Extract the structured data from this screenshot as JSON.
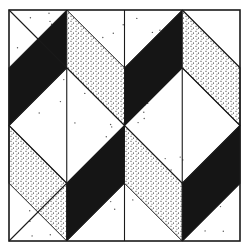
{
  "figure": {
    "type": "quilt-block-pattern",
    "colors": {
      "background": "#ffffff",
      "line": "#1a1a1a",
      "solid": "#151515",
      "stipple_dot": "#2a2a2a"
    },
    "grid": {
      "x0": 9,
      "y0": 10,
      "size": 231,
      "divisions": 4
    },
    "patches": [
      {
        "kind": "solid",
        "points": [
          [
            0,
            1
          ],
          [
            1,
            0
          ],
          [
            1,
            1
          ],
          [
            0,
            2
          ]
        ]
      },
      {
        "kind": "stipple",
        "points": [
          [
            1,
            0
          ],
          [
            2,
            1
          ],
          [
            2,
            2
          ],
          [
            1,
            1
          ]
        ]
      },
      {
        "kind": "solid",
        "points": [
          [
            2,
            1
          ],
          [
            3,
            0
          ],
          [
            3,
            1
          ],
          [
            2,
            2
          ]
        ]
      },
      {
        "kind": "stipple",
        "points": [
          [
            3,
            0
          ],
          [
            4,
            1
          ],
          [
            4,
            2
          ],
          [
            3,
            1
          ]
        ]
      },
      {
        "kind": "stipple",
        "points": [
          [
            0,
            2
          ],
          [
            1,
            3
          ],
          [
            1,
            4
          ],
          [
            0,
            3
          ]
        ]
      },
      {
        "kind": "solid",
        "points": [
          [
            1,
            3
          ],
          [
            2,
            2
          ],
          [
            2,
            3
          ],
          [
            1,
            4
          ]
        ]
      },
      {
        "kind": "stipple",
        "points": [
          [
            2,
            2
          ],
          [
            3,
            3
          ],
          [
            3,
            4
          ],
          [
            2,
            3
          ]
        ]
      },
      {
        "kind": "solid",
        "points": [
          [
            3,
            3
          ],
          [
            4,
            2
          ],
          [
            4,
            3
          ],
          [
            3,
            4
          ]
        ]
      }
    ],
    "lines": [
      [
        [
          2,
          0
        ],
        [
          2,
          1
        ]
      ],
      [
        [
          1,
          1
        ],
        [
          1,
          3
        ]
      ],
      [
        [
          3,
          1
        ],
        [
          3,
          3
        ]
      ],
      [
        [
          2,
          3
        ],
        [
          2,
          4
        ]
      ],
      [
        [
          0,
          2
        ],
        [
          1,
          1
        ]
      ],
      [
        [
          1,
          1
        ],
        [
          2,
          2
        ]
      ],
      [
        [
          2,
          2
        ],
        [
          3,
          1
        ]
      ],
      [
        [
          3,
          1
        ],
        [
          4,
          2
        ]
      ],
      [
        [
          0,
          2
        ],
        [
          1,
          3
        ]
      ],
      [
        [
          1,
          3
        ],
        [
          2,
          2
        ]
      ],
      [
        [
          2,
          2
        ],
        [
          3,
          3
        ]
      ],
      [
        [
          3,
          3
        ],
        [
          4,
          2
        ]
      ],
      [
        [
          0,
          0
        ],
        [
          1,
          1
        ]
      ],
      [
        [
          3,
          0
        ],
        [
          4,
          1
        ]
      ],
      [
        [
          0,
          4
        ],
        [
          1,
          3
        ]
      ],
      [
        [
          3,
          4
        ],
        [
          4,
          3
        ]
      ]
    ]
  }
}
